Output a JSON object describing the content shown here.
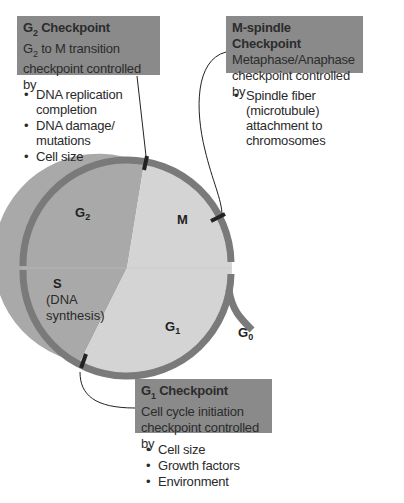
{
  "colors": {
    "box_bg": "#8a8a8a",
    "ring": "#7a7a7a",
    "left_half": "#a9a9a9",
    "right_half": "#d4d4d4",
    "marker": "#222222"
  },
  "checkpoints": {
    "g2": {
      "title_main": "G",
      "title_sub": "2",
      "title_rest": " Checkpoint",
      "desc_main": "G",
      "desc_sub": "2",
      "desc_rest": " to M transition",
      "desc_line2": "checkpoint controlled by",
      "bullets": [
        "DNA replication completion",
        "DNA damage/ mutations",
        "Cell size"
      ]
    },
    "m": {
      "title": "M-spindle Checkpoint",
      "desc_line1": "Metaphase/Anaphase",
      "desc_line2": "checkpoint controlled by",
      "bullets": [
        "Spindle fiber (microtubule) attachment to chromosomes"
      ]
    },
    "g1": {
      "title_main": "G",
      "title_sub": "1",
      "title_rest": " Checkpoint",
      "desc_line1": "Cell cycle initiation",
      "desc_line2": "checkpoint controlled by",
      "bullets": [
        "Cell size",
        "Growth factors",
        "Environment"
      ]
    }
  },
  "phases": {
    "g2": {
      "main": "G",
      "sub": "2"
    },
    "m": {
      "main": "M"
    },
    "s": {
      "main": "S",
      "note_line1": "(DNA",
      "note_line2": "synthesis)"
    },
    "g1": {
      "main": "G",
      "sub": "1"
    },
    "g0": {
      "main": "G",
      "sub": "0"
    }
  }
}
